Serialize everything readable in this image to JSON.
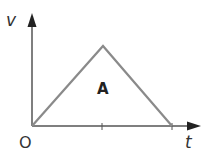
{
  "diagram": {
    "type": "velocity-time graph",
    "y_axis_label": "v",
    "x_axis_label": "t",
    "origin_label": "O",
    "area_label": "A",
    "shape": "triangle",
    "colors": {
      "axes": "#555555",
      "graph_line": "#8a8a8a",
      "text": "#333333"
    },
    "points": [
      {
        "x": 0,
        "y": 0
      },
      {
        "x": 1,
        "y": 1
      },
      {
        "x": 2,
        "y": 0
      }
    ],
    "x_ticks": [
      1,
      2
    ]
  }
}
